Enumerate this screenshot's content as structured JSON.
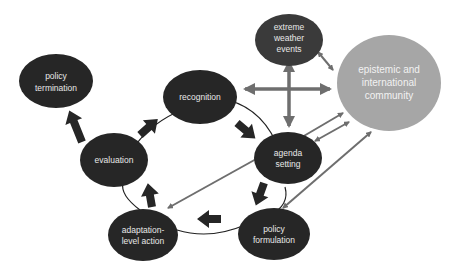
{
  "diagram": {
    "type": "policy-cycle",
    "colors": {
      "node_dark": "#262626",
      "node_light": "#a6a6a6",
      "arrow_dark": "#262626",
      "arrow_gray": "#6e6e6e",
      "text": "#e8e8e8"
    },
    "nodes": {
      "policy_termination": {
        "line1": "policy",
        "line2": "termination"
      },
      "recognition": {
        "line1": "recognition"
      },
      "evaluation": {
        "line1": "evaluation"
      },
      "agenda_setting": {
        "line1": "agenda",
        "line2": "setting"
      },
      "adaptation": {
        "line1": "adaptation-",
        "line2": "level action"
      },
      "policy_formulation": {
        "line1": "policy",
        "line2": "formulation"
      },
      "extreme_weather": {
        "line1": "extreme",
        "line2": "weather",
        "line3": "events"
      },
      "epistemic": {
        "line1": "epistemic and",
        "line2": "international",
        "line3": "community"
      }
    },
    "edges": [
      {
        "from": "evaluation",
        "to": "policy termination",
        "style": "thick-dark"
      },
      {
        "from": "evaluation",
        "to": "recognition",
        "style": "thick-dark"
      },
      {
        "from": "recognition",
        "to": "agenda setting",
        "style": "thick-dark"
      },
      {
        "from": "agenda setting",
        "to": "policy formulation",
        "style": "thick-dark"
      },
      {
        "from": "policy formulation",
        "to": "adaptation-level action",
        "style": "thick-dark"
      },
      {
        "from": "adaptation-level action",
        "to": "evaluation",
        "style": "thick-dark"
      },
      {
        "from": "extreme weather events",
        "to": "epistemic and international community",
        "style": "gray-bidirectional"
      },
      {
        "from": "cross-center",
        "to": "recognition / epistemic / extreme weather / agenda setting",
        "style": "gray-cross-4way"
      },
      {
        "from": "agenda setting",
        "to": "epistemic and international community",
        "style": "gray-bidirectional"
      },
      {
        "from": "epistemic and international community",
        "to": "adaptation-level action",
        "style": "gray"
      },
      {
        "from": "epistemic and international community",
        "to": "policy formulation",
        "style": "gray-bidirectional"
      }
    ]
  }
}
